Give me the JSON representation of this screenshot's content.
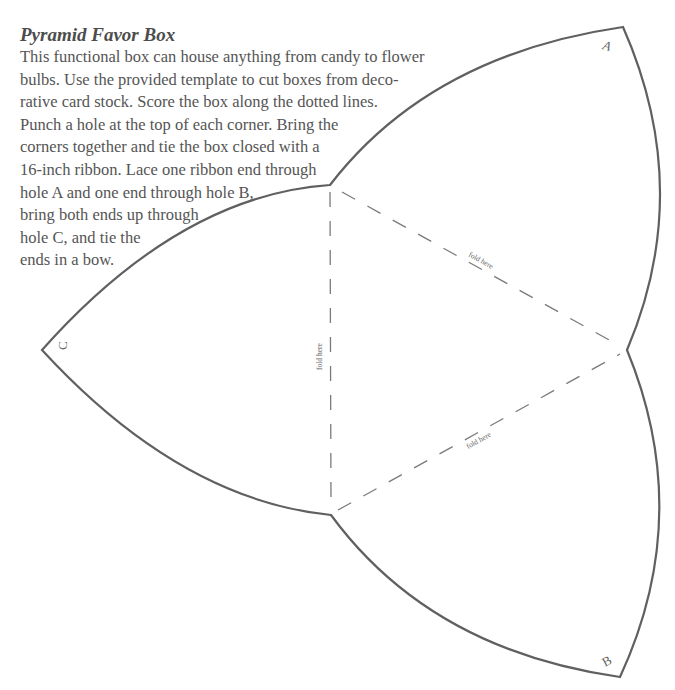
{
  "document": {
    "title": "Pyramid Favor Box",
    "body_lines": [
      "This functional box can house anything from candy to flower",
      "bulbs. Use the provided template to cut boxes from deco-",
      "rative card stock. Score the box along the dotted lines.",
      "Punch a hole at the top of each corner. Bring the",
      "corners together and tie the box closed with a",
      "16-inch ribbon. Lace one ribbon end through",
      "hole A and one end through hole B,",
      "bring both ends up through",
      "hole C, and tie the",
      "ends in a bow."
    ]
  },
  "template": {
    "corner_labels": {
      "a": "A",
      "b": "B",
      "c": "C"
    },
    "fold_labels": {
      "left": "fold here",
      "upper_right": "fold here",
      "lower_right": "fold here"
    },
    "colors": {
      "outline": "#606060",
      "fold_line": "#7a7a7a",
      "text": "#555555"
    }
  }
}
